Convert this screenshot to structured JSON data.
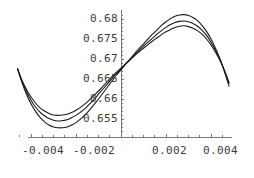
{
  "chart_data": {
    "type": "line",
    "title": "",
    "subtitle": "",
    "xlabel": "",
    "ylabel": "",
    "grid": false,
    "legend": "none",
    "axis_style": "mathematica-cross-axes",
    "xlim": [
      -0.005,
      0.005
    ],
    "ylim": [
      0.6505,
      0.6818
    ],
    "x_ticks": [
      {
        "value": -0.004,
        "label": "-0.004"
      },
      {
        "value": -0.002,
        "label": "-0.002"
      },
      {
        "value": 0.002,
        "label": "0.002"
      },
      {
        "value": 0.004,
        "label": "0.004"
      }
    ],
    "y_ticks": [
      {
        "value": 0.68,
        "label": "0.68"
      },
      {
        "value": 0.675,
        "label": "0.675"
      },
      {
        "value": 0.67,
        "label": "0.67"
      },
      {
        "value": 0.665,
        "label": "0.665"
      },
      {
        "value": 0.66,
        "label": "0.66"
      },
      {
        "value": 0.655,
        "label": "0.655"
      }
    ],
    "x_minor_ticks": [
      -0.0045,
      -0.0035,
      -0.003,
      -0.0025,
      -0.0015,
      -0.001,
      -0.0005,
      0.0005,
      0.001,
      0.0015,
      0.0025,
      0.003,
      0.0035,
      0.0045
    ],
    "y_minor_ticks": [
      0.681,
      0.679,
      0.678,
      0.677,
      0.676,
      0.674,
      0.673,
      0.672,
      0.671,
      0.669,
      0.668,
      0.667,
      0.666,
      0.664,
      0.663,
      0.662,
      0.661,
      0.659,
      0.658,
      0.657,
      0.656,
      0.654,
      0.653,
      0.652
    ],
    "x_axis_y_value": 0.6505,
    "y_axis_x_value": 0.0,
    "line_color": "#1a1a1a",
    "axis_color": "#7a7a7a",
    "tick_label_color": "#3a3a3a",
    "background_color": "#ffffff",
    "series": [
      {
        "name": "curve-1",
        "amplitude_label": "outer",
        "x": [
          -0.0046,
          -0.0044,
          -0.0042,
          -0.004,
          -0.0038,
          -0.0036,
          -0.0034,
          -0.0032,
          -0.003,
          -0.0028,
          -0.0026,
          -0.0024,
          -0.0022,
          -0.002,
          -0.0018,
          -0.0016,
          -0.0014,
          -0.0012,
          -0.001,
          -0.0008,
          -0.0006,
          -0.0004,
          -0.0002,
          0.0,
          0.0002,
          0.0004,
          0.0006,
          0.0008,
          0.001,
          0.0012,
          0.0014,
          0.0016,
          0.0018,
          0.002,
          0.0022,
          0.0024,
          0.0026,
          0.0028,
          0.003,
          0.0032,
          0.0034,
          0.0036,
          0.0038,
          0.004,
          0.0042,
          0.0044,
          0.0046,
          0.0048
        ],
        "y": [
          0.6676,
          0.6641,
          0.6612,
          0.6588,
          0.6569,
          0.6554,
          0.6543,
          0.6535,
          0.653,
          0.6528,
          0.6528,
          0.653,
          0.6535,
          0.6541,
          0.655,
          0.656,
          0.6572,
          0.6586,
          0.66,
          0.6615,
          0.663,
          0.6645,
          0.666,
          0.6673,
          0.6687,
          0.67,
          0.6713,
          0.6726,
          0.6738,
          0.675,
          0.6762,
          0.6773,
          0.6784,
          0.6793,
          0.6801,
          0.6807,
          0.681,
          0.6811,
          0.6809,
          0.6804,
          0.6796,
          0.6784,
          0.6769,
          0.675,
          0.6727,
          0.67,
          0.6668,
          0.6632
        ]
      },
      {
        "name": "curve-2",
        "amplitude_label": "middle",
        "x": [
          -0.0046,
          -0.0044,
          -0.0042,
          -0.004,
          -0.0038,
          -0.0036,
          -0.0034,
          -0.0032,
          -0.003,
          -0.0028,
          -0.0026,
          -0.0024,
          -0.0022,
          -0.002,
          -0.0018,
          -0.0016,
          -0.0014,
          -0.0012,
          -0.001,
          -0.0008,
          -0.0006,
          -0.0004,
          -0.0002,
          0.0,
          0.0002,
          0.0004,
          0.0006,
          0.0008,
          0.001,
          0.0012,
          0.0014,
          0.0016,
          0.0018,
          0.002,
          0.0022,
          0.0024,
          0.0026,
          0.0028,
          0.003,
          0.0032,
          0.0034,
          0.0036,
          0.0038,
          0.004,
          0.0042,
          0.0044,
          0.0046,
          0.0048
        ],
        "y": [
          0.6676,
          0.6644,
          0.6618,
          0.6597,
          0.658,
          0.6567,
          0.6558,
          0.6551,
          0.6547,
          0.6545,
          0.6546,
          0.6548,
          0.6553,
          0.6559,
          0.6567,
          0.6576,
          0.6587,
          0.6599,
          0.6612,
          0.6625,
          0.6638,
          0.6651,
          0.6664,
          0.6675,
          0.6687,
          0.6698,
          0.671,
          0.6721,
          0.6732,
          0.6742,
          0.6752,
          0.6762,
          0.6771,
          0.6779,
          0.6786,
          0.6791,
          0.6794,
          0.6795,
          0.6793,
          0.6789,
          0.6782,
          0.6772,
          0.6759,
          0.6742,
          0.6722,
          0.6699,
          0.6671,
          0.6639
        ]
      },
      {
        "name": "curve-3",
        "amplitude_label": "inner",
        "x": [
          -0.0046,
          -0.0044,
          -0.0042,
          -0.004,
          -0.0038,
          -0.0036,
          -0.0034,
          -0.0032,
          -0.003,
          -0.0028,
          -0.0026,
          -0.0024,
          -0.0022,
          -0.002,
          -0.0018,
          -0.0016,
          -0.0014,
          -0.0012,
          -0.001,
          -0.0008,
          -0.0006,
          -0.0004,
          -0.0002,
          0.0,
          0.0002,
          0.0004,
          0.0006,
          0.0008,
          0.001,
          0.0012,
          0.0014,
          0.0016,
          0.0018,
          0.002,
          0.0022,
          0.0024,
          0.0026,
          0.0028,
          0.003,
          0.0032,
          0.0034,
          0.0036,
          0.0038,
          0.004,
          0.0042,
          0.0044,
          0.0046,
          0.0048
        ],
        "y": [
          0.6676,
          0.6647,
          0.6624,
          0.6605,
          0.659,
          0.6578,
          0.657,
          0.6564,
          0.656,
          0.6559,
          0.656,
          0.6562,
          0.6566,
          0.6572,
          0.6579,
          0.6588,
          0.6598,
          0.6609,
          0.662,
          0.6632,
          0.6644,
          0.6656,
          0.6667,
          0.6677,
          0.6688,
          0.6698,
          0.6708,
          0.6718,
          0.6727,
          0.6736,
          0.6745,
          0.6753,
          0.6761,
          0.6768,
          0.6774,
          0.6779,
          0.6782,
          0.6783,
          0.6781,
          0.6777,
          0.6771,
          0.6762,
          0.675,
          0.6735,
          0.6717,
          0.6696,
          0.6671,
          0.6642
        ]
      }
    ]
  }
}
